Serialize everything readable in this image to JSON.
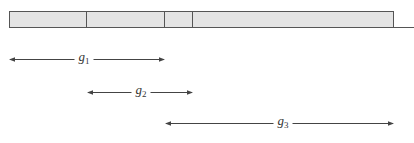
{
  "colors": {
    "bar_fill": "#e4e4e4",
    "bar_stroke": "#555555",
    "arrow": "#444444",
    "text": "#333333"
  },
  "bar": {
    "x_start": 9,
    "x_end": 393,
    "y_top": 11,
    "y_bottom": 27,
    "baseline_extends_to": 414,
    "segments": [
      {
        "name": "segment-1",
        "x_start": 9,
        "x_end": 86
      },
      {
        "name": "segment-2",
        "x_start": 86,
        "x_end": 164
      },
      {
        "name": "segment-3",
        "x_start": 164,
        "x_end": 192
      },
      {
        "name": "segment-4",
        "x_start": 192,
        "x_end": 393
      }
    ]
  },
  "spans": [
    {
      "name": "g1",
      "base": "g",
      "sub": "1",
      "x_start": 9,
      "x_end": 164,
      "y": 59,
      "label_x": 84
    },
    {
      "name": "g2",
      "base": "g",
      "sub": "2",
      "x_start": 87,
      "x_end": 192,
      "y": 92,
      "label_x": 141
    },
    {
      "name": "g3",
      "base": "g",
      "sub": "3",
      "x_start": 165,
      "x_end": 393,
      "y": 123,
      "label_x": 283
    }
  ]
}
